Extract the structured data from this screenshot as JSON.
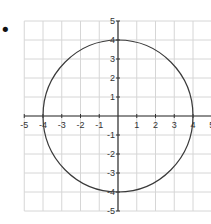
{
  "chart_data": {
    "type": "line",
    "title": "",
    "xlabel": "",
    "ylabel": "",
    "xlim": [
      -5,
      5
    ],
    "ylim": [
      -5,
      5
    ],
    "grid": true,
    "legend": null,
    "x_ticks": [
      -5,
      -4,
      -3,
      -2,
      -1,
      1,
      2,
      3,
      4,
      5
    ],
    "y_ticks": [
      5,
      4,
      3,
      2,
      1,
      -1,
      -2,
      -3,
      -4,
      -5
    ],
    "x_tick_labels": [
      "-5",
      "-4",
      "-3",
      "-2",
      "-1",
      "1",
      "2",
      "3",
      "4",
      "5"
    ],
    "y_tick_labels": [
      "5",
      "4",
      "3",
      "2",
      "1",
      "-1",
      "-2",
      "-3",
      "-4",
      "-5"
    ],
    "series": [
      {
        "name": "circle",
        "shape": "circle",
        "center": [
          0,
          0
        ],
        "radius": 4,
        "equation": "x^2 + y^2 = 16"
      }
    ]
  },
  "layout": {
    "origin_px": [
      118,
      116
    ],
    "unit_px_x": 18.75,
    "unit_px_y": 19,
    "colors": {
      "grid": "#d6d6d6",
      "axis": "#333333",
      "curve": "#3a3a3a",
      "bullet": "#111111"
    }
  },
  "bullet": {
    "symbol": "•"
  }
}
